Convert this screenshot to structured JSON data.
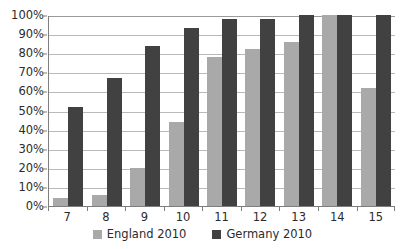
{
  "chart_data": {
    "type": "bar",
    "title": "",
    "subtitle": "",
    "xlabel": "",
    "ylabel": "",
    "categories": [
      "7",
      "8",
      "9",
      "10",
      "11",
      "12",
      "13",
      "14",
      "15"
    ],
    "series": [
      {
        "name": "England 2010",
        "color": "#a9a9a9",
        "values": [
          4,
          6,
          20,
          44,
          78,
          82,
          86,
          100,
          62
        ]
      },
      {
        "name": "Germany 2010",
        "color": "#414141",
        "values": [
          52,
          67,
          84,
          93,
          98,
          98,
          100,
          100,
          100
        ]
      }
    ],
    "ylim": [
      0,
      100
    ],
    "y_ticks": [
      "0%",
      "10%",
      "20%",
      "30%",
      "40%",
      "50%",
      "60%",
      "70%",
      "80%",
      "90%",
      "100%"
    ],
    "y_tick_values": [
      0,
      10,
      20,
      30,
      40,
      50,
      60,
      70,
      80,
      90,
      100
    ],
    "value_suffix": "%",
    "grid": true,
    "legend_position": "bottom"
  },
  "legend": {
    "entries": [
      {
        "label": "England 2010"
      },
      {
        "label": "Germany 2010"
      }
    ]
  }
}
